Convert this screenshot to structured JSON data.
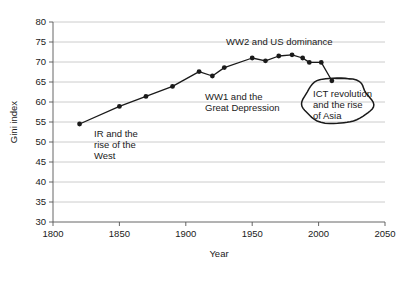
{
  "chart_data": {
    "type": "line",
    "title": "",
    "xlabel": "Year",
    "ylabel": "Gini index",
    "xlim": [
      1800,
      2050
    ],
    "ylim": [
      30,
      80
    ],
    "xticks": [
      1800,
      1850,
      1900,
      1950,
      2000,
      2050
    ],
    "yticks": [
      30,
      35,
      40,
      45,
      50,
      55,
      60,
      65,
      70,
      75,
      80
    ],
    "grid": "horizontal",
    "legend": "none",
    "series": [
      {
        "name": "Global Gini index",
        "x": [
          1820,
          1850,
          1870,
          1890,
          1910,
          1920,
          1929,
          1950,
          1960,
          1970,
          1980,
          1988,
          1993,
          2002,
          2010
        ],
        "values": [
          54.5,
          58.9,
          61.4,
          63.9,
          67.6,
          66.5,
          68.6,
          71.0,
          70.3,
          71.5,
          71.8,
          71.0,
          69.9,
          69.9,
          65.3
        ]
      }
    ],
    "annotations": [
      {
        "id": "ir-west",
        "lines": [
          "IR and the",
          "rise of the",
          "West"
        ],
        "x_px": 94,
        "y_px": 137
      },
      {
        "id": "ww1-depression",
        "lines": [
          "WW1 and the",
          "Great Depression"
        ],
        "x_px": 205,
        "y_px": 100
      },
      {
        "id": "ww2-us-dominance",
        "lines": [
          "WW2 and US dominance"
        ],
        "x_px": 226,
        "y_px": 45
      },
      {
        "id": "ict-asia",
        "lines": [
          "ICT revolution",
          "and the rise",
          "of Asia"
        ],
        "x_px": 313,
        "y_px": 93
      }
    ],
    "highlight": {
      "name": "hand-drawn-ellipse",
      "center_x_px": 337,
      "center_y_px": 101,
      "rx_px": 35,
      "ry_px": 23
    },
    "colors": {
      "line": "#1a1a1a",
      "marker": "#1a1a1a",
      "grid": "#bfbfbf",
      "axis": "#555555",
      "text": "#1a1a1a",
      "background": "#ffffff"
    }
  },
  "axes": {
    "x_title": "Year",
    "y_title": "Gini index",
    "x_tick_labels": [
      "1800",
      "1850",
      "1900",
      "1950",
      "2000",
      "2050"
    ],
    "y_tick_labels": [
      "80",
      "75",
      "70",
      "65",
      "60",
      "55",
      "50",
      "45",
      "40",
      "35",
      "30"
    ]
  },
  "annotation_text": {
    "ir_line1": "IR and the",
    "ir_line2": "rise of the",
    "ir_line3": "West",
    "ww1_line1": "WW1 and the",
    "ww1_line2": "Great Depression",
    "ww2_line1": "WW2 and US dominance",
    "ict_line1": "ICT revolution",
    "ict_line2": "and the rise",
    "ict_line3": "of Asia"
  }
}
